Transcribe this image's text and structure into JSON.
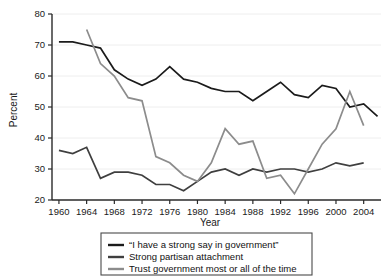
{
  "chart_data": {
    "type": "line",
    "title": "",
    "xlabel": "Year",
    "ylabel": "Percent",
    "xlim": [
      1958,
      2006
    ],
    "ylim": [
      20,
      80
    ],
    "xticks": [
      1960,
      1964,
      1968,
      1972,
      1976,
      1980,
      1984,
      1988,
      1992,
      1996,
      2000,
      2004
    ],
    "yticks": [
      20,
      30,
      40,
      50,
      60,
      70,
      80
    ],
    "grid": "horizontal",
    "legend_position": "bottom",
    "series": [
      {
        "name": "“I have a strong say in government”",
        "color": "#1b1b1b",
        "x": [
          1960,
          1962,
          1964,
          1966,
          1968,
          1970,
          1972,
          1974,
          1976,
          1978,
          1980,
          1982,
          1984,
          1986,
          1988,
          1990,
          1992,
          1994,
          1996,
          1998,
          2000,
          2002,
          2004,
          2006
        ],
        "y": [
          71,
          71,
          70,
          69,
          62,
          59,
          57,
          59,
          63,
          59,
          58,
          56,
          55,
          55,
          52,
          55,
          58,
          54,
          53,
          57,
          56,
          50,
          51,
          47
        ]
      },
      {
        "name": "Strong partisan attachment",
        "color": "#3f3f3f",
        "x": [
          1960,
          1962,
          1964,
          1966,
          1968,
          1970,
          1972,
          1974,
          1976,
          1978,
          1980,
          1982,
          1984,
          1986,
          1988,
          1990,
          1992,
          1994,
          1996,
          1998,
          2000,
          2002,
          2004
        ],
        "y": [
          36,
          35,
          37,
          27,
          29,
          29,
          28,
          25,
          25,
          23,
          26,
          29,
          30,
          28,
          30,
          29,
          30,
          30,
          29,
          30,
          32,
          31,
          32
        ]
      },
      {
        "name": "Trust government most or all of the time",
        "color": "#8c8c8c",
        "x": [
          1964,
          1966,
          1968,
          1970,
          1972,
          1974,
          1976,
          1978,
          1980,
          1982,
          1984,
          1986,
          1988,
          1990,
          1992,
          1994,
          1996,
          1998,
          2000,
          2002,
          2004
        ],
        "y": [
          75,
          64,
          60,
          53,
          52,
          34,
          32,
          28,
          26,
          32,
          43,
          38,
          39,
          27,
          28,
          22,
          30,
          38,
          43,
          55,
          44
        ]
      }
    ]
  },
  "axes": {
    "ylabel": "Percent",
    "xlabel": "Year",
    "ytick_labels": [
      "20",
      "30",
      "40",
      "50",
      "60",
      "70",
      "80"
    ],
    "xtick_labels": [
      "1960",
      "1964",
      "1968",
      "1972",
      "1976",
      "1980",
      "1984",
      "1988",
      "1992",
      "1996",
      "2000",
      "2004"
    ]
  },
  "legend": {
    "items": [
      {
        "label": "“I have a strong say in government”",
        "color": "#1b1b1b"
      },
      {
        "label": "Strong partisan attachment",
        "color": "#3f3f3f"
      },
      {
        "label": "Trust government most or all of the time",
        "color": "#8c8c8c"
      }
    ]
  }
}
